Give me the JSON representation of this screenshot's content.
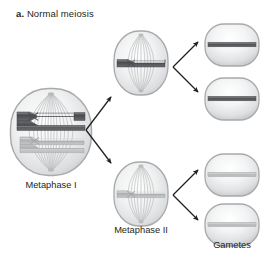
{
  "figure": {
    "panel_letter": "a.",
    "panel_title": "Normal meiosis",
    "background_color": "#ffffff",
    "text_color": "#231f20"
  },
  "colors": {
    "chromosome_dark": "#58585b",
    "chromosome_dark_edge": "#3f3f42",
    "chromosome_light": "#b7b8ba",
    "chromosome_light_edge": "#97999b",
    "cell_outline": "#a7a9ac",
    "cell_fill_light": "#fdfdfd",
    "cell_fill_mid": "#e8e9ea",
    "cell_fill_shadow": "#c9cbcd",
    "spindle_fiber": "#bcbec0",
    "arrow": "#231f20"
  },
  "cells": [
    {
      "id": "metaphase-i",
      "name": "metaphase-i-cell",
      "label": "Metaphase I",
      "stage": "Metaphase I",
      "shape": "rounded-rectangle",
      "chromosome_count": 4,
      "chromosomes": [
        {
          "color": "dark",
          "centromere": "crossed"
        },
        {
          "color": "dark",
          "centromere": "crossed"
        },
        {
          "color": "light",
          "centromere": "crossed"
        },
        {
          "color": "light",
          "centromere": "crossed"
        }
      ]
    },
    {
      "id": "metaphase-ii-top",
      "name": "metaphase-ii-top-cell",
      "label": "",
      "stage": "Metaphase II",
      "shape": "rounded-rectangle",
      "chromosome_count": 1,
      "chromosomes": [
        {
          "color": "dark",
          "centromere": "crossed"
        }
      ]
    },
    {
      "id": "metaphase-ii-bottom",
      "name": "metaphase-ii-bottom-cell",
      "label": "Metaphase II",
      "stage": "Metaphase II",
      "shape": "rounded-rectangle",
      "chromosome_count": 1,
      "chromosomes": [
        {
          "color": "light",
          "centromere": "crossed"
        }
      ]
    }
  ],
  "gametes": {
    "label": "Gametes",
    "count": 4,
    "items": [
      {
        "id": "gamete-1",
        "name": "gamete-cell-1",
        "chromosome_color": "dark"
      },
      {
        "id": "gamete-2",
        "name": "gamete-cell-2",
        "chromosome_color": "dark"
      },
      {
        "id": "gamete-3",
        "name": "gamete-cell-3",
        "chromosome_color": "light"
      },
      {
        "id": "gamete-4",
        "name": "gamete-cell-4",
        "chromosome_color": "light"
      }
    ]
  },
  "arrows": [
    {
      "id": "arrow-mi-to-mii-top",
      "from": "metaphase-i",
      "to": "metaphase-ii-top",
      "direction": "up-right"
    },
    {
      "id": "arrow-mi-to-mii-bottom",
      "from": "metaphase-i",
      "to": "metaphase-ii-bottom",
      "direction": "down-right"
    },
    {
      "id": "arrow-miitop-to-g1",
      "from": "metaphase-ii-top",
      "to": "gamete-1",
      "direction": "up-right"
    },
    {
      "id": "arrow-miitop-to-g2",
      "from": "metaphase-ii-top",
      "to": "gamete-2",
      "direction": "down-right"
    },
    {
      "id": "arrow-miibot-to-g3",
      "from": "metaphase-ii-bottom",
      "to": "gamete-3",
      "direction": "up-right"
    },
    {
      "id": "arrow-miibot-to-g4",
      "from": "metaphase-ii-bottom",
      "to": "gamete-4",
      "direction": "down-right"
    }
  ]
}
